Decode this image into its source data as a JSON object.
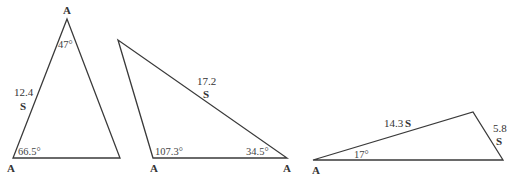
{
  "triangles": [
    {
      "id": "triangle-1",
      "vertices": [
        [
          67,
          19
        ],
        [
          13,
          158
        ],
        [
          120,
          158
        ]
      ],
      "vertex_labels": [
        {
          "text": "A",
          "x": 63,
          "y": 14
        },
        {
          "text": "A",
          "x": 7,
          "y": 172
        }
      ],
      "angles": [
        {
          "text": "47°",
          "x": 60,
          "y": 48
        },
        {
          "text": "66.5°",
          "x": 18,
          "y": 155
        }
      ],
      "sides": [
        {
          "value": "12.4",
          "marker": "S",
          "x": 14,
          "y": 98
        }
      ]
    },
    {
      "id": "triangle-2",
      "vertices": [
        [
          118,
          40
        ],
        [
          153,
          158
        ],
        [
          287,
          158
        ]
      ],
      "vertex_labels": [
        {
          "text": "A",
          "x": 150,
          "y": 172
        },
        {
          "text": "A",
          "x": 283,
          "y": 172
        }
      ],
      "angles": [
        {
          "text": "107.3°",
          "x": 155,
          "y": 155
        },
        {
          "text": "34.5°",
          "x": 246,
          "y": 155
        }
      ],
      "sides": [
        {
          "value": "17.2",
          "marker": "S",
          "x": 197,
          "y": 86
        }
      ]
    },
    {
      "id": "triangle-3",
      "vertices": [
        [
          313,
          160
        ],
        [
          473,
          112
        ],
        [
          503,
          160
        ]
      ],
      "vertex_labels": [
        {
          "text": "A",
          "x": 312,
          "y": 174
        }
      ],
      "angles": [
        {
          "text": "17°",
          "x": 354,
          "y": 158
        }
      ],
      "sides": [
        {
          "value": "14.3",
          "marker": "S",
          "x": 384,
          "y": 126,
          "inline": true
        },
        {
          "value": "5.8",
          "marker": "S",
          "x": 494,
          "y": 130
        }
      ]
    }
  ]
}
